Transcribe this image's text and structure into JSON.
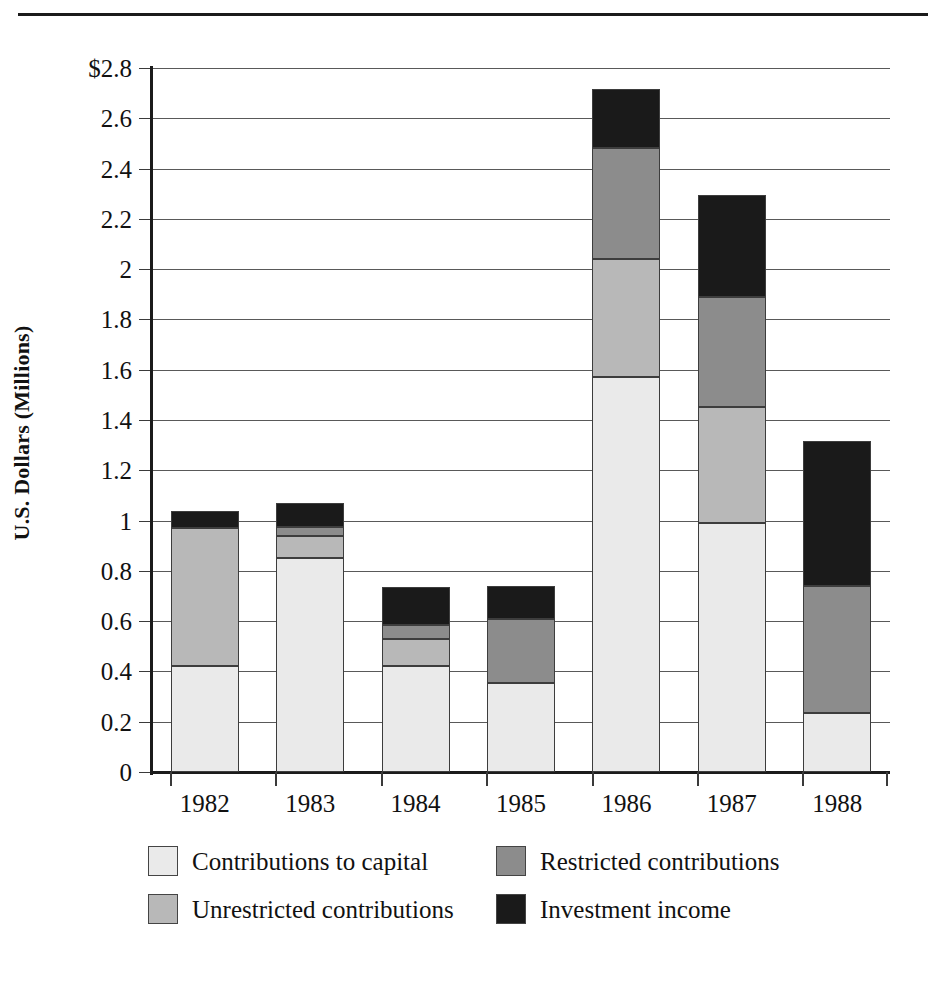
{
  "chart_data": {
    "type": "bar",
    "subtype": "stacked",
    "title": "",
    "xlabel": "",
    "ylabel": "U.S. Dollars (Millions)",
    "ylim": [
      0,
      2.8
    ],
    "ytick_labels": [
      "$2.8",
      "2.6",
      "2.4",
      "2.2",
      "2",
      "1.8",
      "1.6",
      "1.4",
      "1.2",
      "1",
      "0.8",
      "0.6",
      "0.4",
      "0.2",
      "0"
    ],
    "ytick_values": [
      2.8,
      2.6,
      2.4,
      2.2,
      2.0,
      1.8,
      1.6,
      1.4,
      1.2,
      1.0,
      0.8,
      0.6,
      0.4,
      0.2,
      0
    ],
    "grid": true,
    "legend_position": "bottom",
    "categories": [
      "1982",
      "1983",
      "1984",
      "1985",
      "1986",
      "1987",
      "1988"
    ],
    "series": [
      {
        "name": "Contributions to capital",
        "color": "#eaeaea",
        "values": [
          0.42,
          0.85,
          0.42,
          0.355,
          1.57,
          0.99,
          0.235
        ]
      },
      {
        "name": "Unrestricted contributions",
        "color": "#b8b8b8",
        "values": [
          0.55,
          0.09,
          0.11,
          0.0,
          0.47,
          0.46,
          0.0
        ]
      },
      {
        "name": "Restricted contributions",
        "color": "#8c8c8c",
        "values": [
          0.0,
          0.035,
          0.055,
          0.255,
          0.44,
          0.44,
          0.505
        ]
      },
      {
        "name": "Investment income",
        "color": "#1a1a1a",
        "values": [
          0.07,
          0.095,
          0.15,
          0.13,
          0.235,
          0.405,
          0.575
        ]
      }
    ],
    "totals": [
      1.04,
      1.07,
      0.735,
      0.74,
      2.715,
      2.295,
      1.315
    ]
  },
  "legend": {
    "items": [
      {
        "label": "Contributions to capital",
        "swatch": "light-gray-swatch"
      },
      {
        "label": "Restricted contributions",
        "swatch": "medium-gray-swatch"
      },
      {
        "label": "Unrestricted contributions",
        "swatch": "gray-swatch"
      },
      {
        "label": "Investment income",
        "swatch": "black-swatch"
      }
    ]
  }
}
